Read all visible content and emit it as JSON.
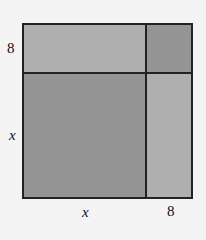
{
  "diagram": {
    "labels": {
      "left_top": "8",
      "left_bottom": "x",
      "bottom_left": "x",
      "bottom_right": "8"
    },
    "regions": [
      {
        "id": "top-left",
        "dimensions": "x by 8",
        "shade": "light",
        "color": "#b9b9b9"
      },
      {
        "id": "top-right",
        "dimensions": "8 by 8",
        "shade": "dark",
        "color": "#9f9f9f"
      },
      {
        "id": "bottom-left",
        "dimensions": "x by x",
        "shade": "dark",
        "color": "#9f9f9f"
      },
      {
        "id": "bottom-right",
        "dimensions": "8 by x",
        "shade": "light",
        "color": "#b9b9b9"
      }
    ],
    "border_color": "#222222"
  }
}
